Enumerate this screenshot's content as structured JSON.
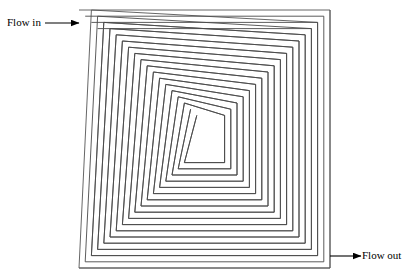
{
  "figure": {
    "title": "",
    "type": "square-spiral-flow-channel-diagram",
    "background_color": "#ffffff",
    "line_color": "#4a4a4a",
    "outer_line_color": "#555555",
    "arrow_color": "#000000",
    "text_color": "#000000"
  },
  "labels": {
    "flow_in": "Flow in",
    "flow_out": "Flow out"
  },
  "annotations": [
    {
      "name": "flow-in-arrow",
      "text": "Flow in",
      "direction": "right",
      "from_x": 45,
      "from_y": 23,
      "to_x": 79,
      "to_y": 23
    },
    {
      "name": "flow-out-arrow",
      "text": "Flow out",
      "direction": "right",
      "from_x": 330,
      "from_y": 256,
      "to_x": 360,
      "to_y": 256
    }
  ],
  "geometry": {
    "outer_box": {
      "left": 79,
      "top": 10,
      "right": 330,
      "bottom": 268
    },
    "center": {
      "x": 203,
      "y": 142
    },
    "turns": 9,
    "channel_gap": 6.2,
    "wall_pitch": 12.4,
    "stroke_width": 0.9,
    "inlet_side": "top-left",
    "outlet_side": "bottom-right"
  }
}
